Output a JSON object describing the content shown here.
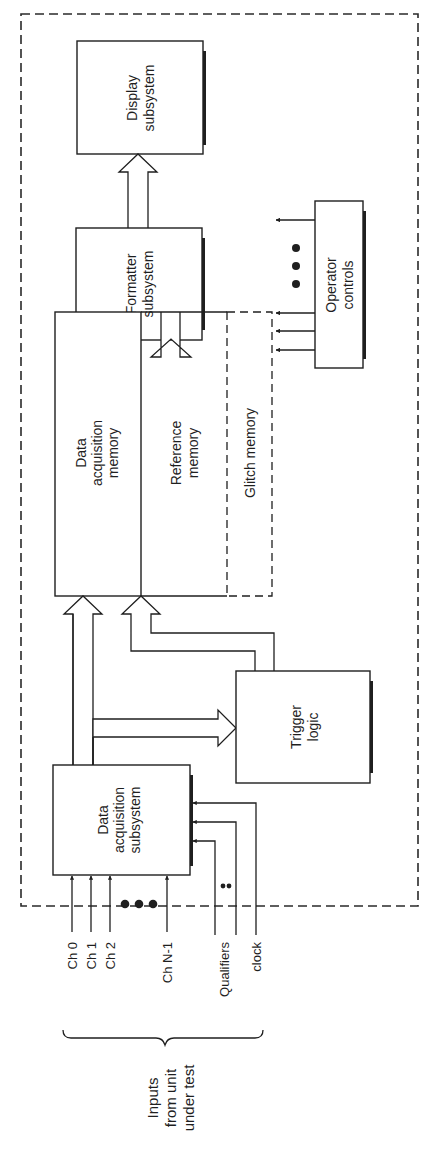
{
  "diagram": {
    "orientation": "rotated 90 degrees counter-clockwise",
    "enclosure": {
      "style": "dashed",
      "label": ""
    },
    "blocks": {
      "display": {
        "line1": "Display",
        "line2": "subsystem"
      },
      "formatter": {
        "line1": "Formatter",
        "line2": "subsystem"
      },
      "acq_memory": {
        "line1": "Data",
        "line2": "acquisition",
        "line3": "memory"
      },
      "ref_memory": {
        "line1": "Reference",
        "line2": "memory"
      },
      "glitch_memory": {
        "line1": "Glitch memory",
        "style": "dashed"
      },
      "operator_controls": {
        "line1": "Operator",
        "line2": "controls"
      },
      "trigger": {
        "line1": "Trigger",
        "line2": "logic"
      },
      "acq_subsystem": {
        "line1": "Data",
        "line2": "acquisition",
        "line3": "subsystem"
      }
    },
    "inputs": {
      "channels": [
        "Ch 0",
        "Ch 1",
        "Ch 2",
        "Ch N-1"
      ],
      "qualifiers": "Qualifiers",
      "clock": "clock",
      "group_label": {
        "line1": "Inputs",
        "line2": "from unit",
        "line3": "under test"
      }
    },
    "ellipsis": "•••",
    "connections": [
      {
        "from": "Data acquisition subsystem",
        "to": "Data acquisition memory",
        "type": "bus"
      },
      {
        "from": "Data acquisition subsystem",
        "to": "Trigger logic",
        "type": "bus"
      },
      {
        "from": "Trigger logic",
        "to": "Reference memory",
        "type": "bus"
      },
      {
        "from": "Data acquisition memory",
        "to": "Formatter subsystem",
        "type": "bus"
      },
      {
        "from": "Reference memory",
        "to": "Formatter subsystem",
        "type": "bus"
      },
      {
        "from": "Formatter subsystem",
        "to": "Display subsystem",
        "type": "bus"
      },
      {
        "from": "Inputs from unit under test",
        "to": "Data acquisition subsystem",
        "type": "signal"
      },
      {
        "from": "Operator controls",
        "to": "system",
        "type": "signal"
      }
    ]
  }
}
